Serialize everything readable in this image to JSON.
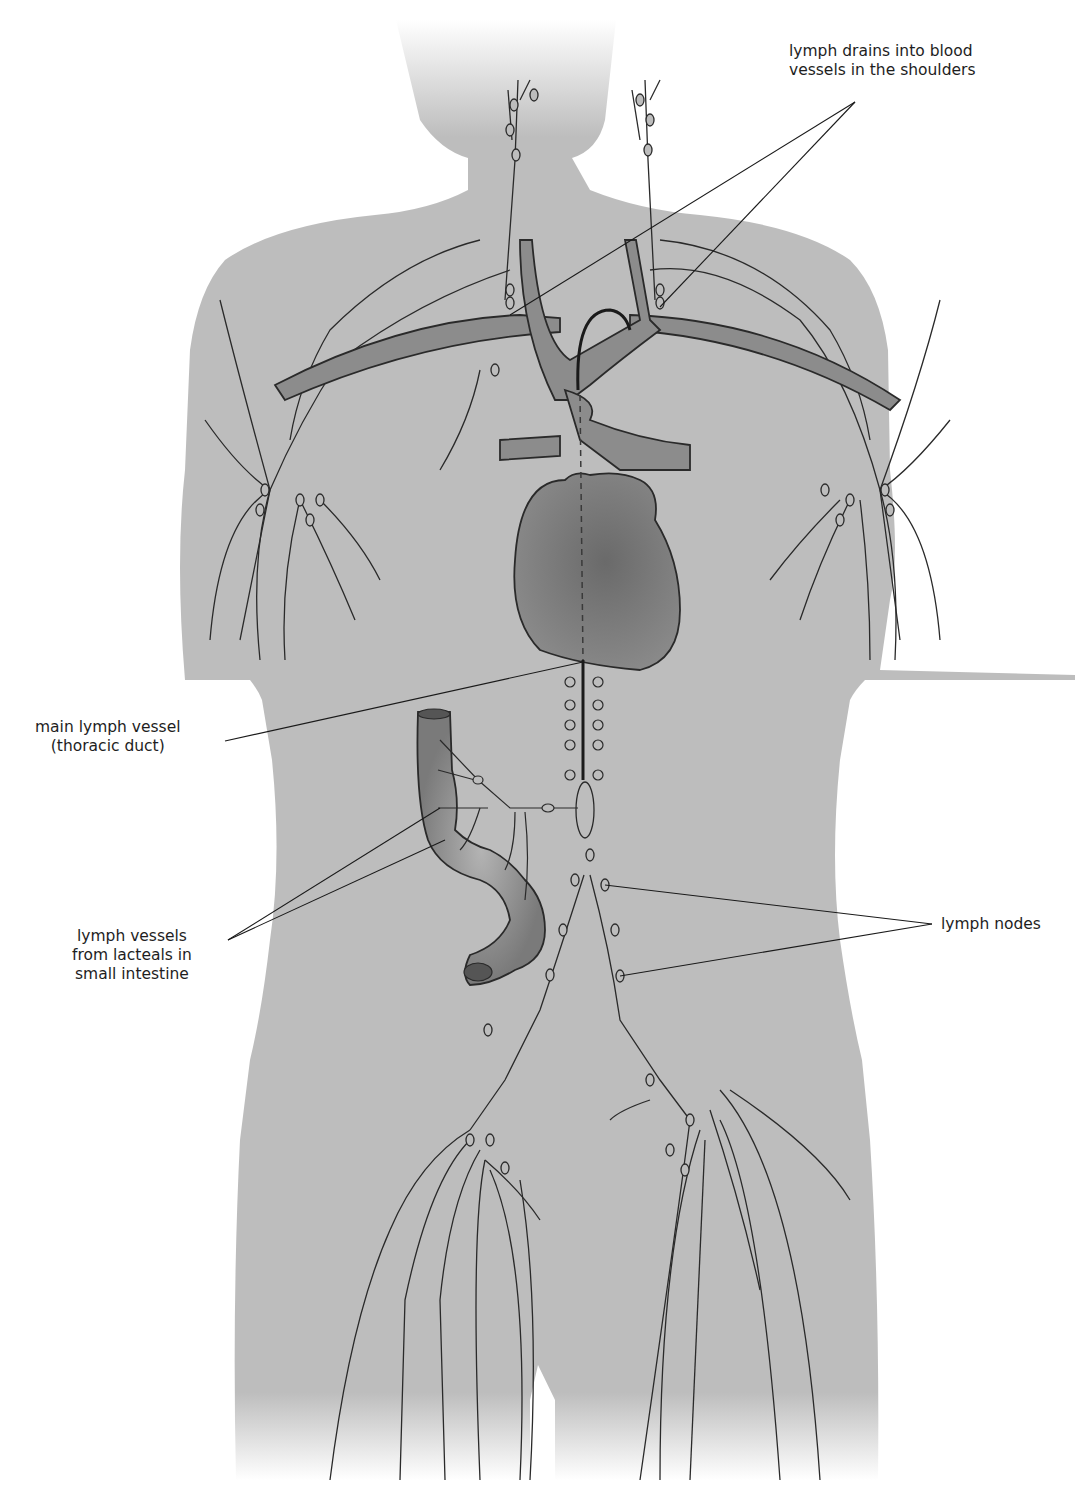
{
  "diagram": {
    "colors": {
      "background": "#ffffff",
      "body": "#bdbdbd",
      "vessel": "#8c8c8c",
      "heart": "#7a7a7a",
      "line": "#2a2a2a",
      "text": "#1e1e1e"
    },
    "labels": {
      "shoulders": {
        "line1": "lymph drains into blood",
        "line2": "vessels in the shoulders"
      },
      "thoracic_duct": {
        "line1": "main lymph vessel",
        "line2": "(thoracic duct)"
      },
      "lacteals": {
        "line1": "lymph vessels",
        "line2": "from lacteals in",
        "line3": "small intestine"
      },
      "nodes": {
        "line1": "lymph nodes"
      }
    }
  }
}
